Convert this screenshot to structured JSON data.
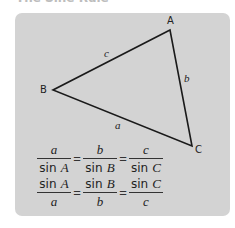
{
  "heading": "The Sine Rule",
  "triangle": {
    "vertices": {
      "A": "A",
      "B": "B",
      "C": "C"
    },
    "sides": {
      "a": "a",
      "b": "b",
      "c": "c"
    }
  },
  "formulas": {
    "row1": [
      {
        "num": "a",
        "den_sin": "sin",
        "den_var": "A"
      },
      {
        "num": "b",
        "den_sin": "sin",
        "den_var": "B"
      },
      {
        "num": "c",
        "den_sin": "sin",
        "den_var": "C"
      }
    ],
    "row2": [
      {
        "num_sin": "sin",
        "num_var": "A",
        "den": "a"
      },
      {
        "num_sin": "sin",
        "num_var": "B",
        "den": "b"
      },
      {
        "num_sin": "sin",
        "num_var": "C",
        "den": "c"
      }
    ],
    "equals": "="
  },
  "colors": {
    "panel": "#d3d3d3",
    "line": "#1a1a1a"
  }
}
